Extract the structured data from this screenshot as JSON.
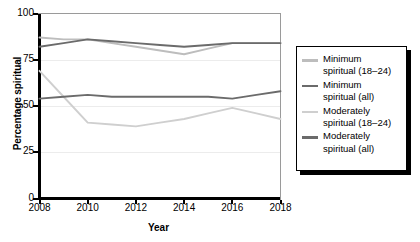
{
  "chart_data": {
    "type": "line",
    "title": "",
    "xlabel": "Year",
    "ylabel": "Percentage spiritual",
    "x": [
      2008,
      2009,
      2010,
      2011,
      2012,
      2013,
      2014,
      2015,
      2016,
      2017,
      2018
    ],
    "xticks": [
      "2008",
      "2010",
      "2012",
      "2014",
      "2016",
      "2018"
    ],
    "xtick_values": [
      2008,
      2010,
      2012,
      2014,
      2016,
      2018
    ],
    "yticks": [
      "0",
      "25",
      "50",
      "75",
      "100"
    ],
    "ytick_values": [
      0,
      25,
      50,
      75,
      100
    ],
    "xlim": [
      2008,
      2018
    ],
    "ylim": [
      0,
      100
    ],
    "grid": "horizontal",
    "legend_position": "right",
    "series": [
      {
        "name": "Minimum spiritual (18–24)",
        "label_lines": "Minimum\nspiritual (18–24)",
        "color": "#bdbdbd",
        "x": [
          2008,
          2009,
          2010,
          2011,
          2012,
          2013,
          2014,
          2015,
          2016,
          2017,
          2018
        ],
        "values": [
          87,
          86,
          86,
          84,
          82,
          80,
          78,
          81,
          84,
          84,
          84
        ]
      },
      {
        "name": "Minimum spiritual (all)",
        "label_lines": "Minimum\nspiritual (all)",
        "color": "#6b6b6b",
        "x": [
          2008,
          2009,
          2010,
          2011,
          2012,
          2013,
          2014,
          2015,
          2016,
          2017,
          2018
        ],
        "values": [
          82,
          84,
          86,
          85,
          84,
          83,
          82,
          83,
          84,
          84,
          84
        ]
      },
      {
        "name": "Moderately spiritual (18–24)",
        "label_lines": "Moderately\nspiritual (18–24)",
        "color": "#cfcfcf",
        "x": [
          2008,
          2009,
          2010,
          2011,
          2012,
          2013,
          2014,
          2015,
          2016,
          2017,
          2018
        ],
        "values": [
          69,
          55,
          41,
          40,
          39,
          41,
          43,
          46,
          49,
          46,
          43
        ]
      },
      {
        "name": "Moderately spiritual (all)",
        "label_lines": "Moderately\nspiritual (all)",
        "color": "#6b6b6b",
        "x": [
          2008,
          2009,
          2010,
          2011,
          2012,
          2013,
          2014,
          2015,
          2016,
          2017,
          2018
        ],
        "values": [
          54,
          55,
          56,
          55,
          55,
          55,
          55,
          55,
          54,
          56,
          58
        ]
      }
    ]
  },
  "axes": {
    "ylabel": "Percentage spiritual",
    "xlabel": "Year",
    "ytick_0": "0",
    "ytick_1": "25",
    "ytick_2": "50",
    "ytick_3": "75",
    "ytick_4": "100",
    "xtick_0": "2008",
    "xtick_1": "2010",
    "xtick_2": "2012",
    "xtick_3": "2014",
    "xtick_4": "2016",
    "xtick_5": "2018"
  },
  "legend": {
    "items": [
      {
        "label": "Minimum\nspiritual (18–24)",
        "color": "#bdbdbd"
      },
      {
        "label": "Minimum\nspiritual (all)",
        "color": "#6b6b6b"
      },
      {
        "label": "Moderately\nspiritual (18–24)",
        "color": "#cfcfcf"
      },
      {
        "label": "Moderately\nspiritual (all)",
        "color": "#6b6b6b"
      }
    ]
  },
  "colors": {
    "axis": "#000000",
    "grid": "#ececec",
    "frame": "#9a9a9a",
    "background": "#ffffff"
  }
}
